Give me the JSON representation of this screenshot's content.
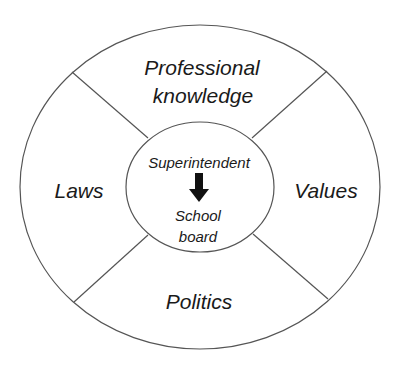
{
  "diagram": {
    "center": {
      "top_label": "Superintendent",
      "bottom_label_line1": "School",
      "bottom_label_line2": "board",
      "arrow": "down-arrow"
    },
    "segments": {
      "top_line1": "Professional",
      "top_line2": "knowledge",
      "left": "Laws",
      "right": "Values",
      "bottom": "Politics"
    },
    "colors": {
      "stroke": "#555555",
      "text": "#1a1a1a",
      "background": "#ffffff"
    }
  }
}
